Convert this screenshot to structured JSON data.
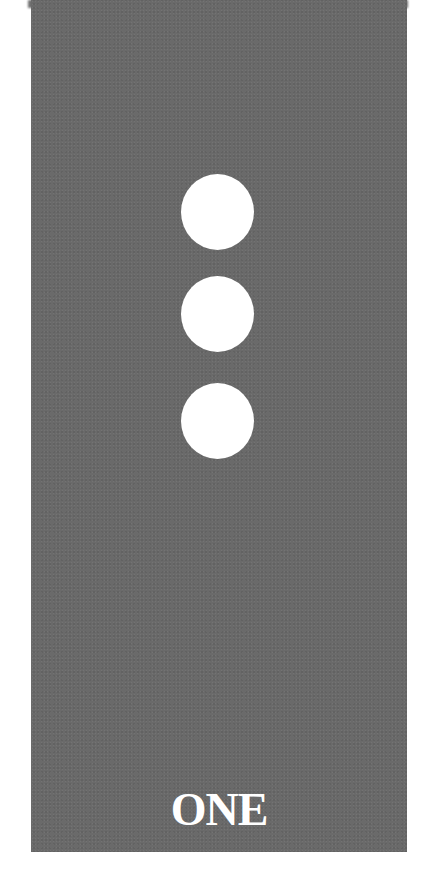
{
  "card": {
    "label": "ONE",
    "background_color": "#6a6a6a",
    "dot_color": "#ffffff",
    "dots": [
      {
        "index": 1
      },
      {
        "index": 2
      },
      {
        "index": 3
      }
    ]
  }
}
